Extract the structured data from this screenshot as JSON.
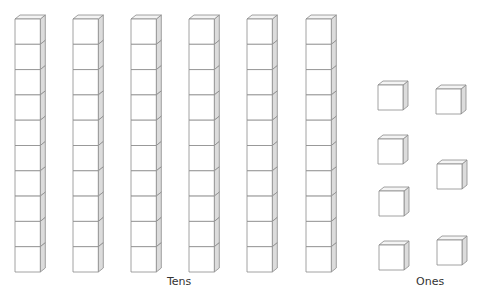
{
  "tens": {
    "label": "Tens",
    "rods": 6,
    "cubes_per_rod": 10,
    "rod_x": [
      15,
      73,
      131,
      189,
      247,
      306
    ],
    "rod_top": 19,
    "cube_size": 25.3
  },
  "ones": {
    "label": "Ones",
    "count": 7,
    "cubes": [
      {
        "x": 378,
        "y": 85
      },
      {
        "x": 436,
        "y": 89
      },
      {
        "x": 378,
        "y": 139
      },
      {
        "x": 437,
        "y": 164
      },
      {
        "x": 379,
        "y": 191
      },
      {
        "x": 379,
        "y": 245
      },
      {
        "x": 437,
        "y": 240
      }
    ],
    "cube_size": 25
  },
  "represented_number": 67,
  "colors": {
    "face": "#ffffff",
    "top": "#f4f4f4",
    "side": "#dcdcdc",
    "edge": "#8a8a8a"
  }
}
